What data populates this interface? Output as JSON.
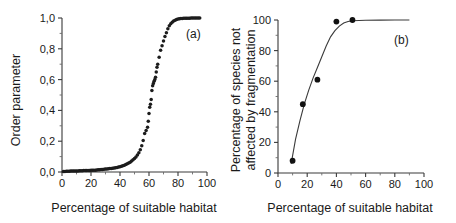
{
  "figure": {
    "panels": [
      {
        "id": "a",
        "label": "(a)",
        "xlabel": "Percentage of suitable habitat",
        "ylabel": "Order parameter"
      },
      {
        "id": "b",
        "label": "(b)",
        "xlabel": "Percentage of suitable habitat",
        "ylabel_line1": "Percentage of species not",
        "ylabel_line2": "affected by fragmentation"
      }
    ]
  },
  "chart_data": [
    {
      "type": "scatter",
      "panel": "a",
      "title": "",
      "xlabel": "Percentage of suitable habitat",
      "ylabel": "Order parameter",
      "xlim": [
        0,
        100
      ],
      "ylim": [
        0.0,
        1.0
      ],
      "xticks": [
        0,
        20,
        40,
        60,
        80,
        100
      ],
      "yticks": [
        0.0,
        0.2,
        0.4,
        0.6,
        0.8,
        1.0
      ],
      "xticklabels": [
        "0",
        "20",
        "40",
        "60",
        "80",
        "100"
      ],
      "yticklabels": [
        "0,0",
        "0,2",
        "0,4",
        "0,6",
        "0,8",
        "1,0"
      ],
      "decimal_separator": ",",
      "grid": false,
      "legend": false,
      "annotations": [
        "(a)"
      ],
      "marker": "filled-circle",
      "marker_color": "#1c1c1c",
      "x": [
        1,
        2,
        3,
        4,
        5,
        6,
        7,
        8,
        9,
        10,
        11,
        12,
        13,
        14,
        15,
        16,
        17,
        18,
        19,
        20,
        21,
        22,
        23,
        24,
        25,
        26,
        27,
        28,
        29,
        30,
        31,
        32,
        33,
        34,
        35,
        36,
        37,
        38,
        39,
        40,
        41,
        42,
        43,
        44,
        45,
        46,
        47,
        48,
        49,
        50,
        51,
        52,
        53,
        54,
        55,
        56,
        57,
        58,
        59,
        59.5,
        60,
        60.5,
        61,
        61.5,
        62,
        62.5,
        63,
        63.5,
        64,
        64.5,
        65,
        65.5,
        66,
        67,
        68,
        69,
        70,
        71,
        72,
        73,
        74,
        75,
        76,
        77,
        78,
        79,
        80,
        81,
        82,
        83,
        84,
        85,
        86,
        87,
        88,
        89,
        90,
        91,
        92,
        93,
        94,
        95
      ],
      "y": [
        0.004,
        0.004,
        0.005,
        0.005,
        0.005,
        0.006,
        0.006,
        0.006,
        0.007,
        0.007,
        0.007,
        0.008,
        0.008,
        0.008,
        0.009,
        0.009,
        0.009,
        0.01,
        0.01,
        0.011,
        0.011,
        0.012,
        0.012,
        0.013,
        0.014,
        0.015,
        0.016,
        0.017,
        0.018,
        0.019,
        0.02,
        0.021,
        0.022,
        0.023,
        0.025,
        0.026,
        0.028,
        0.03,
        0.032,
        0.034,
        0.037,
        0.04,
        0.044,
        0.048,
        0.053,
        0.058,
        0.064,
        0.071,
        0.079,
        0.088,
        0.098,
        0.11,
        0.125,
        0.145,
        0.17,
        0.205,
        0.25,
        0.27,
        0.29,
        0.33,
        0.38,
        0.42,
        0.44,
        0.47,
        0.53,
        0.56,
        0.575,
        0.59,
        0.6,
        0.615,
        0.65,
        0.68,
        0.7,
        0.745,
        0.79,
        0.82,
        0.85,
        0.88,
        0.905,
        0.93,
        0.95,
        0.962,
        0.972,
        0.98,
        0.985,
        0.99,
        0.993,
        0.995,
        0.996,
        0.997,
        0.998,
        0.998,
        0.999,
        0.999,
        0.999,
        1.0,
        1.0,
        1.0,
        1.0,
        1.0,
        1.0,
        1.0,
        1.0
      ]
    },
    {
      "type": "scatter",
      "panel": "b",
      "title": "",
      "xlabel": "Percentage of suitable habitat",
      "ylabel": "Percentage of species not affected by fragmentation",
      "xlim": [
        0,
        100
      ],
      "ylim": [
        0,
        100
      ],
      "xticks": [
        0,
        20,
        40,
        60,
        80,
        100
      ],
      "yticks": [
        0,
        20,
        40,
        60,
        80,
        100
      ],
      "xticklabels": [
        "0",
        "20",
        "40",
        "60",
        "80",
        "100"
      ],
      "yticklabels": [
        "0",
        "20",
        "40",
        "60",
        "80",
        "100"
      ],
      "grid": false,
      "legend": false,
      "annotations": [
        "(b)"
      ],
      "marker": "filled-circle",
      "marker_color": "#111111",
      "x": [
        10,
        17,
        27,
        40,
        51
      ],
      "y": [
        8,
        45,
        61,
        99,
        100
      ],
      "fit_curve": {
        "present": true,
        "style": "sigmoid",
        "x": [
          9,
          12,
          15,
          18,
          21,
          24,
          27,
          30,
          33,
          36,
          39,
          42,
          45,
          48,
          51,
          60,
          70,
          80,
          90
        ],
        "y": [
          6,
          22,
          34,
          45,
          54,
          62,
          69,
          76,
          83,
          89,
          93,
          96,
          98,
          99,
          99.5,
          99.8,
          99.9,
          100,
          100
        ]
      }
    }
  ]
}
